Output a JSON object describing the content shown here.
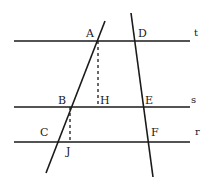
{
  "figure": {
    "background_color": "#ffffff",
    "stroke_color": "#1a1a1a",
    "width": 209,
    "height": 177
  },
  "parallel_lines": [
    {
      "name": "t",
      "label": "t",
      "label_x": 194,
      "label_y": 28,
      "x1": 14,
      "y1": 41,
      "x2": 190,
      "y2": 41,
      "stroke_width": 1.6
    },
    {
      "name": "s",
      "label": "s",
      "label_x": 191,
      "label_y": 95,
      "x1": 14,
      "y1": 107,
      "x2": 190,
      "y2": 107,
      "stroke_width": 1.6
    },
    {
      "name": "r",
      "label": "r",
      "label_x": 195,
      "label_y": 127,
      "x1": 14,
      "y1": 142,
      "x2": 190,
      "y2": 142,
      "stroke_width": 1.6
    }
  ],
  "transversals": [
    {
      "name": "transversal-left",
      "x1": 105,
      "y1": 21,
      "x2": 46,
      "y2": 173,
      "stroke_width": 1.6
    },
    {
      "name": "transversal-right",
      "x1": 131,
      "y1": 13,
      "x2": 153,
      "y2": 177,
      "stroke_width": 1.6
    }
  ],
  "dashed_segments": [
    {
      "name": "segment-AH",
      "from": "A",
      "to": "H",
      "x1": 98,
      "y1": 41,
      "x2": 98,
      "y2": 107,
      "dash": "3,3",
      "stroke_width": 1.3
    },
    {
      "name": "segment-BJ",
      "from": "B",
      "to": "J",
      "x1": 70,
      "y1": 107,
      "x2": 70,
      "y2": 142,
      "dash": "3,3",
      "stroke_width": 1.3
    }
  ],
  "points": [
    {
      "id": "A",
      "label": "A",
      "x": 86,
      "y": 28,
      "on": "t"
    },
    {
      "id": "D",
      "label": "D",
      "x": 138,
      "y": 28,
      "on": "t"
    },
    {
      "id": "B",
      "label": "B",
      "x": 58,
      "y": 95,
      "on": "s"
    },
    {
      "id": "H",
      "label": "H",
      "x": 100,
      "y": 95,
      "on": "s"
    },
    {
      "id": "E",
      "label": "E",
      "x": 145,
      "y": 95,
      "on": "s"
    },
    {
      "id": "C",
      "label": "C",
      "x": 40,
      "y": 127,
      "on": "r"
    },
    {
      "id": "F",
      "label": "F",
      "x": 151,
      "y": 127,
      "on": "r"
    },
    {
      "id": "J",
      "label": "J",
      "x": 66,
      "y": 146,
      "on": "r"
    }
  ]
}
